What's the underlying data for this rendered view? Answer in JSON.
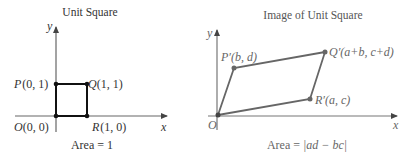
{
  "left_panel": {
    "title": "Unit Square",
    "axis_x_label": "x",
    "axis_y_label": "y",
    "points": {
      "O": {
        "name": "O",
        "coords": "(0, 0)"
      },
      "P": {
        "name": "P",
        "coords": "(0, 1)"
      },
      "Q": {
        "name": "Q",
        "coords": "(1, 1)"
      },
      "R": {
        "name": "R",
        "coords": "(1, 0)"
      }
    },
    "area_prefix": "Area = ",
    "area_value": "1"
  },
  "right_panel": {
    "title": "Image of Unit Square",
    "axis_x_label": "x",
    "axis_y_label": "y",
    "origin_label": "O",
    "points": {
      "P_prime": {
        "name": "P′",
        "coords": "(b, d)"
      },
      "Q_prime": {
        "name": "Q′",
        "coords": "(a+b, c+d)"
      },
      "R_prime": {
        "name": "R′",
        "coords": "(a, c)"
      }
    },
    "area_prefix": "Area = ",
    "area_value": "|ad − bc|"
  },
  "colors": {
    "left_shape": "#111111",
    "right_shape": "#666666",
    "axis": "#666666",
    "background": "#ffffff"
  }
}
